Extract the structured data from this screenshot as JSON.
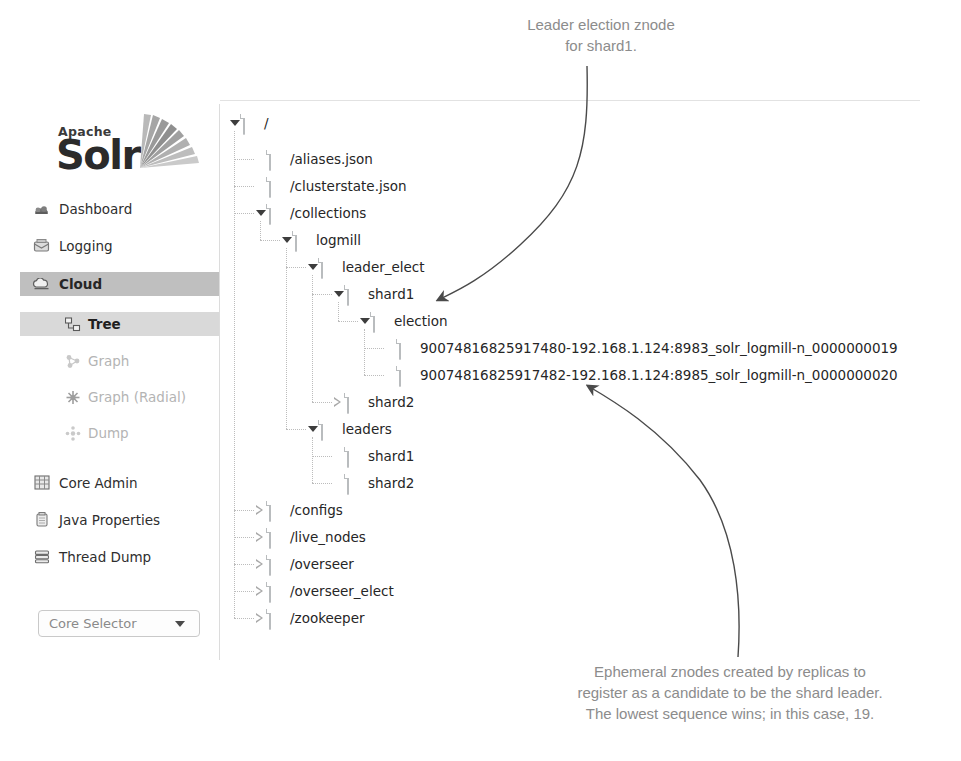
{
  "app": {
    "logo_apache": "Apache",
    "logo_name": "Solr",
    "logo_rays_icon": "solr-sunburst-icon"
  },
  "sidebar": {
    "items": [
      {
        "label": "Dashboard",
        "icon": "dashboard-icon",
        "state": "normal"
      },
      {
        "label": "Logging",
        "icon": "logging-icon",
        "state": "normal"
      },
      {
        "label": "Cloud",
        "icon": "cloud-icon",
        "state": "active"
      }
    ],
    "sub_items": [
      {
        "label": "Tree",
        "icon": "tree-icon",
        "state": "selected"
      },
      {
        "label": "Graph",
        "icon": "graph-icon",
        "state": "dim"
      },
      {
        "label": "Graph (Radial)",
        "icon": "graph-radial-icon",
        "state": "dim"
      },
      {
        "label": "Dump",
        "icon": "dump-icon",
        "state": "dim"
      }
    ],
    "items_lower": [
      {
        "label": "Core Admin",
        "icon": "core-admin-icon",
        "state": "normal"
      },
      {
        "label": "Java Properties",
        "icon": "java-properties-icon",
        "state": "normal"
      },
      {
        "label": "Thread Dump",
        "icon": "thread-dump-icon",
        "state": "normal"
      }
    ],
    "core_selector": {
      "label": "Core Selector",
      "caret_icon": "chevron-down-icon"
    }
  },
  "tree": {
    "nodes": [
      {
        "id": "root",
        "label": "/",
        "depth": 0,
        "type": "folder",
        "toggle": "open",
        "y": 0
      },
      {
        "id": "aliases",
        "label": "/aliases.json",
        "depth": 1,
        "type": "file",
        "toggle": "none",
        "y": 36
      },
      {
        "id": "clusterstate",
        "label": "/clusterstate.json",
        "depth": 1,
        "type": "file",
        "toggle": "none",
        "y": 63
      },
      {
        "id": "collections",
        "label": "/collections",
        "depth": 1,
        "type": "folder",
        "toggle": "open",
        "y": 90
      },
      {
        "id": "logmill",
        "label": "logmill",
        "depth": 2,
        "type": "folder",
        "toggle": "open",
        "y": 117
      },
      {
        "id": "leader_elect",
        "label": "leader_elect",
        "depth": 3,
        "type": "folder",
        "toggle": "open",
        "y": 144
      },
      {
        "id": "shard1",
        "label": "shard1",
        "depth": 4,
        "type": "folder",
        "toggle": "open",
        "y": 171
      },
      {
        "id": "election",
        "label": "election",
        "depth": 5,
        "type": "folder",
        "toggle": "open",
        "y": 198
      },
      {
        "id": "znode19",
        "label": "90074816825917480-192.168.1.124:8983_solr_logmill-n_0000000019",
        "depth": 6,
        "type": "file",
        "toggle": "none",
        "y": 225
      },
      {
        "id": "znode20",
        "label": "90074816825917482-192.168.1.124:8985_solr_logmill-n_0000000020",
        "depth": 6,
        "type": "file",
        "toggle": "none",
        "y": 252
      },
      {
        "id": "shard2",
        "label": "shard2",
        "depth": 4,
        "type": "folder",
        "toggle": "closed",
        "y": 279
      },
      {
        "id": "leaders",
        "label": "leaders",
        "depth": 3,
        "type": "folder",
        "toggle": "open",
        "y": 306
      },
      {
        "id": "lshard1",
        "label": "shard1",
        "depth": 4,
        "type": "file",
        "toggle": "none",
        "y": 333
      },
      {
        "id": "lshard2",
        "label": "shard2",
        "depth": 4,
        "type": "file",
        "toggle": "none",
        "y": 360
      },
      {
        "id": "configs",
        "label": "/configs",
        "depth": 1,
        "type": "folder",
        "toggle": "closed",
        "y": 387
      },
      {
        "id": "live_nodes",
        "label": "/live_nodes",
        "depth": 1,
        "type": "folder",
        "toggle": "closed",
        "y": 414
      },
      {
        "id": "overseer",
        "label": "/overseer",
        "depth": 1,
        "type": "folder",
        "toggle": "closed",
        "y": 441
      },
      {
        "id": "overseer_elect",
        "label": "/overseer_elect",
        "depth": 1,
        "type": "folder",
        "toggle": "closed",
        "y": 468
      },
      {
        "id": "zookeeper",
        "label": "/zookeeper",
        "depth": 1,
        "type": "folder",
        "toggle": "closed",
        "y": 495
      }
    ]
  },
  "annotations": {
    "top": "Leader election znode\nfor shard1.",
    "bottom": "Ephemeral znodes created by replicas to\nregister as a candidate to be the shard leader.\nThe lowest sequence wins; in this case, 19."
  },
  "colors": {
    "annotation_text": "#8c8c8c",
    "active_nav_bg": "#bfbfbf",
    "selected_sub_bg": "#d9d9d9",
    "tree_text": "#262626",
    "panel_border": "#e2e2e2",
    "arrow": "#4a4a4a"
  }
}
